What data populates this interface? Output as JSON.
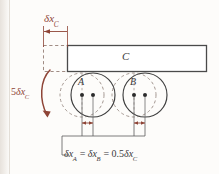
{
  "figure": {
    "kind": "virtual-displacement-diagram",
    "colors": {
      "annotation": "#8e4436",
      "outline": "#4a4a4a",
      "construction": "#8a8a8a",
      "background": "#fdfcfa"
    },
    "bodies": [
      {
        "id": "C",
        "label": "C",
        "shape": "bar",
        "data_name": "body-c-bar"
      },
      {
        "id": "A",
        "label": "A",
        "shape": "wheel",
        "data_name": "wheel-a"
      },
      {
        "id": "B",
        "label": "B",
        "shape": "wheel",
        "data_name": "wheel-b"
      }
    ],
    "annotations": {
      "top_displacement": {
        "symbol": "δ",
        "variable": "x",
        "subscript": "C",
        "text": "δx_C"
      },
      "rotation": {
        "coefficient": "5",
        "symbol": "δ",
        "variable": "x",
        "subscript": "C",
        "text": "5δx_C",
        "sense": "counterclockwise"
      },
      "bottom_relation": {
        "parts": [
          {
            "symbol": "δ",
            "variable": "x",
            "subscript": "A"
          },
          {
            "op": "="
          },
          {
            "symbol": "δ",
            "variable": "x",
            "subscript": "B"
          },
          {
            "op": "="
          },
          {
            "coefficient": "0.5",
            "symbol": "δ",
            "variable": "x",
            "subscript": "C"
          }
        ],
        "text": "δx_A = δx_B = 0.5δx_C"
      }
    }
  }
}
